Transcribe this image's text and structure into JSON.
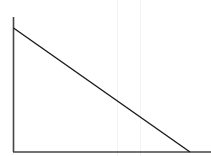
{
  "chart_data": {
    "type": "line",
    "title": "",
    "xlabel": "",
    "ylabel": "",
    "grid": false,
    "legend": null,
    "x": [
      0,
      1
    ],
    "series": [
      {
        "name": "line",
        "values": [
          1,
          0
        ],
        "color": "#1a1a1a"
      }
    ],
    "xlim": [
      0,
      1.12
    ],
    "ylim": [
      0,
      1.09
    ],
    "axes": {
      "color": "#444444",
      "x_axis_visible": true,
      "y_axis_visible": true,
      "ticks": false
    }
  },
  "geometry": {
    "origin": {
      "x": 13.5,
      "y": 152
    },
    "y_axis_top": 17,
    "x_axis_right": 211,
    "line_start": {
      "x": 13.5,
      "y": 28
    },
    "line_end": {
      "x": 190,
      "y": 152
    }
  }
}
